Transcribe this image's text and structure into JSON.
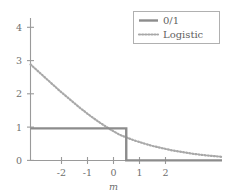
{
  "chart_data": {
    "type": "line",
    "title": "",
    "xlabel": "m",
    "ylabel": "",
    "xlim": [
      -2.9,
      2.9
    ],
    "ylim": [
      0,
      4.45
    ],
    "grid": false,
    "legend_position": "top-right",
    "xticks": [
      -2,
      -1,
      0,
      1,
      2
    ],
    "xtick_labels": [
      "-2",
      "-1",
      "0",
      "1",
      "2"
    ],
    "yticks": [
      0,
      1,
      2,
      3,
      4
    ],
    "ytick_labels": [
      "0",
      "1",
      "2",
      "3",
      "4"
    ],
    "series": [
      {
        "name": "0/1",
        "style": "solid",
        "color": "#8c8c8c",
        "x": [
          -2.9,
          -0.02,
          0,
          0,
          0.02,
          2.9
        ],
        "values": [
          1,
          1,
          1,
          0,
          0,
          0
        ]
      },
      {
        "name": "Logistic",
        "style": "dotted",
        "color": "#a8a8a8",
        "x": [
          -2.9,
          -2.6,
          -2.3,
          -2.0,
          -1.7,
          -1.4,
          -1.1,
          -0.8,
          -0.5,
          -0.2,
          0,
          0.2,
          0.5,
          0.8,
          1.1,
          1.4,
          1.7,
          2.0,
          2.3,
          2.6,
          2.9
        ],
        "values": [
          3.0,
          2.72,
          2.44,
          2.16,
          1.9,
          1.64,
          1.4,
          1.18,
          0.98,
          0.8,
          0.72,
          0.64,
          0.54,
          0.45,
          0.38,
          0.31,
          0.26,
          0.21,
          0.17,
          0.14,
          0.11
        ]
      }
    ]
  },
  "legend": {
    "entries": [
      {
        "label": "0/1",
        "style": "solid"
      },
      {
        "label": "Logistic",
        "style": "dotted"
      }
    ]
  },
  "axes": {
    "x_title": "m",
    "x_tick_labels": [
      "-2",
      "-1",
      "0",
      "1",
      "2"
    ],
    "y_tick_labels": [
      "0",
      "1",
      "2",
      "3",
      "4"
    ]
  },
  "colors": {
    "zero_one_line": "#8c8c8c",
    "logistic_line": "#a8a8a8",
    "axis": "#9a9a9a",
    "text": "#6f6f6f",
    "legend_border": "#b0b0b0",
    "background": "#ffffff"
  }
}
